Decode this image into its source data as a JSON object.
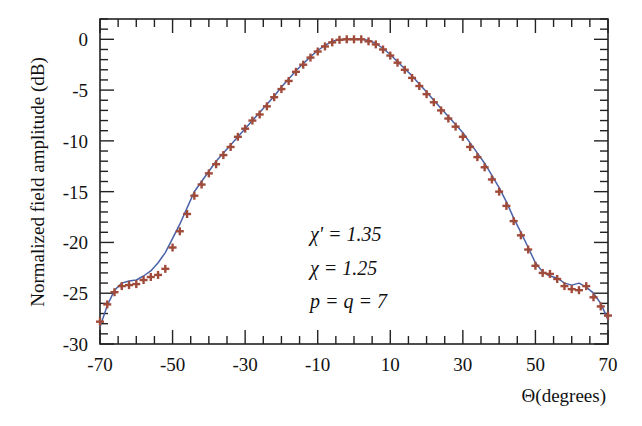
{
  "chart_data": {
    "type": "line",
    "title": "",
    "xlabel": "Θ(degrees)",
    "ylabel": "Normalized field amplitude (dB)",
    "xlim": [
      -70,
      70
    ],
    "ylim": [
      -30,
      2
    ],
    "xticks": [
      -70,
      -50,
      -30,
      -10,
      10,
      30,
      50,
      70
    ],
    "yticks": [
      0,
      -5,
      -10,
      -15,
      -20,
      -25,
      -30
    ],
    "grid": false,
    "annotations": [
      "χ' = 1.35",
      "χ = 1.25",
      "p = q = 7"
    ],
    "series": [
      {
        "name": "simulated (line)",
        "style": "line",
        "color": "#4a62a8",
        "x": [
          -70,
          -68,
          -66,
          -64,
          -62,
          -60,
          -58,
          -56,
          -54,
          -52,
          -50,
          -48,
          -46,
          -44,
          -42,
          -40,
          -38,
          -36,
          -34,
          -32,
          -30,
          -28,
          -26,
          -24,
          -22,
          -20,
          -18,
          -16,
          -14,
          -12,
          -10,
          -8,
          -6,
          -4,
          -2,
          0,
          2,
          4,
          6,
          8,
          10,
          12,
          14,
          16,
          18,
          20,
          22,
          24,
          26,
          28,
          30,
          32,
          34,
          36,
          38,
          40,
          42,
          44,
          46,
          48,
          50,
          52,
          54,
          56,
          58,
          60,
          62,
          64,
          66,
          68,
          70
        ],
        "y": [
          -28.3,
          -26.2,
          -24.7,
          -24.0,
          -23.8,
          -23.7,
          -23.3,
          -22.8,
          -22.0,
          -21.0,
          -19.6,
          -18.2,
          -16.6,
          -15.0,
          -14.0,
          -13.0,
          -12.0,
          -11.2,
          -10.4,
          -9.6,
          -8.8,
          -8.0,
          -7.2,
          -6.4,
          -5.6,
          -4.7,
          -3.9,
          -3.1,
          -2.4,
          -1.7,
          -1.1,
          -0.6,
          -0.2,
          -0.05,
          0,
          0,
          0,
          -0.1,
          -0.4,
          -0.9,
          -1.5,
          -2.2,
          -2.9,
          -3.6,
          -4.4,
          -5.2,
          -6.0,
          -6.8,
          -7.6,
          -8.4,
          -9.2,
          -10.2,
          -11.2,
          -12.2,
          -13.4,
          -14.6,
          -16.0,
          -17.6,
          -19.0,
          -20.5,
          -22.0,
          -22.9,
          -23.3,
          -23.5,
          -24.0,
          -24.2,
          -24.0,
          -24.4,
          -25.0,
          -26.0,
          -27.6
        ]
      },
      {
        "name": "measured (markers)",
        "style": "plus-marker",
        "color": "#a04a3a",
        "x": [
          -70,
          -68,
          -66,
          -64,
          -62,
          -60,
          -58,
          -56,
          -54,
          -52,
          -50,
          -48,
          -46,
          -44,
          -42,
          -40,
          -38,
          -36,
          -34,
          -32,
          -30,
          -28,
          -26,
          -24,
          -22,
          -20,
          -18,
          -16,
          -14,
          -12,
          -10,
          -8,
          -6,
          -4,
          -2,
          0,
          2,
          4,
          6,
          8,
          10,
          12,
          14,
          16,
          18,
          20,
          22,
          24,
          26,
          28,
          30,
          32,
          34,
          36,
          38,
          40,
          42,
          44,
          46,
          48,
          50,
          52,
          54,
          56,
          58,
          60,
          62,
          64,
          66,
          68,
          70
        ],
        "y": [
          -27.8,
          -26.1,
          -24.9,
          -24.3,
          -24.2,
          -24.1,
          -23.7,
          -23.4,
          -23.2,
          -22.6,
          -20.5,
          -18.9,
          -17.2,
          -15.4,
          -14.3,
          -13.2,
          -12.3,
          -11.4,
          -10.6,
          -9.6,
          -8.8,
          -8.0,
          -7.4,
          -6.6,
          -5.7,
          -4.9,
          -4.1,
          -3.2,
          -2.5,
          -1.8,
          -1.2,
          -0.7,
          -0.3,
          -0.05,
          0,
          0,
          0,
          -0.2,
          -0.5,
          -1.0,
          -1.6,
          -2.3,
          -3.0,
          -3.8,
          -4.6,
          -5.4,
          -6.2,
          -7.0,
          -7.8,
          -8.6,
          -9.6,
          -10.6,
          -11.6,
          -12.6,
          -13.8,
          -15.0,
          -16.4,
          -17.9,
          -19.3,
          -20.7,
          -22.3,
          -23.0,
          -23.1,
          -23.6,
          -24.3,
          -24.6,
          -24.7,
          -24.3,
          -25.4,
          -26.3,
          -27.2
        ]
      }
    ]
  }
}
